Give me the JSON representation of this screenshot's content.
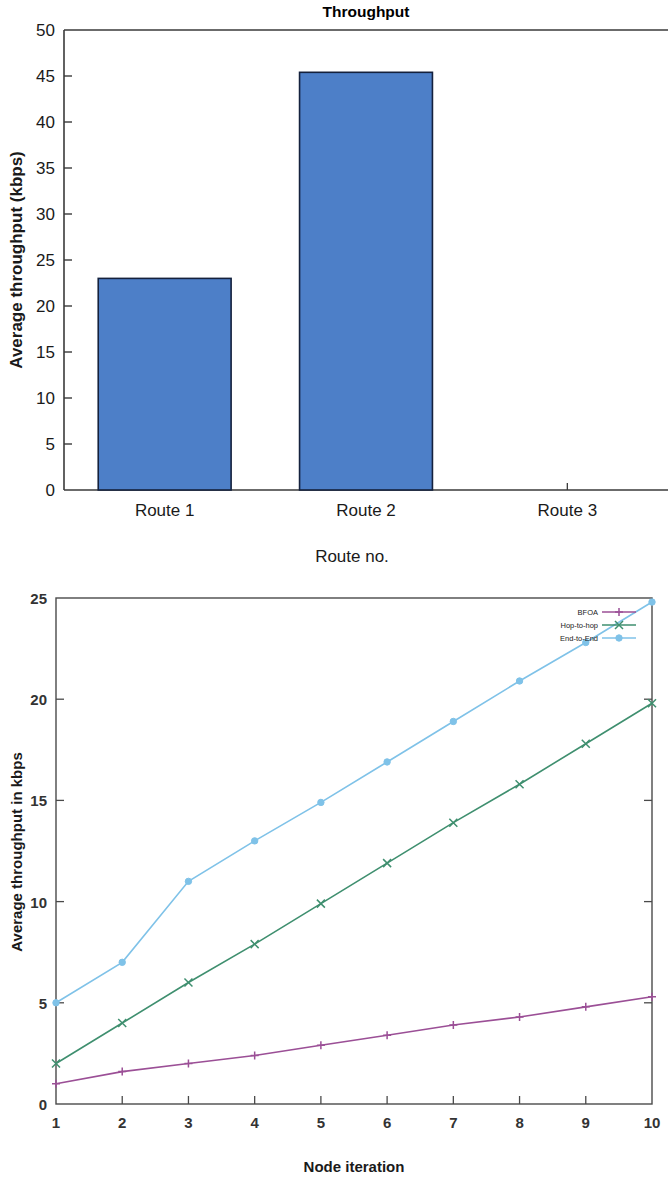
{
  "page": {
    "width": 668,
    "height": 1196,
    "background": "#ffffff"
  },
  "chart_data": [
    {
      "id": "throughput-bar-chart",
      "type": "bar",
      "title": "Throughput",
      "xlabel": "Route no.",
      "ylabel": "Average throughput (kbps)",
      "categories": [
        "Route 1",
        "Route 2",
        "Route 3"
      ],
      "values": [
        23,
        45.4,
        0
      ],
      "ylim": [
        0,
        50
      ],
      "yticks": [
        0,
        5,
        10,
        15,
        20,
        25,
        30,
        35,
        40,
        45,
        50
      ],
      "ytick_labels": [
        "0",
        "5",
        "10",
        "15",
        "20",
        "25",
        "30",
        "35",
        "40",
        "45",
        "50"
      ],
      "grid": false,
      "legend": null,
      "bar_color": "#4d7fc8",
      "bar_edge_color": "#14213d",
      "axis_color": "#3a3a3a",
      "title_color": "#000000"
    },
    {
      "id": "node-iteration-line-chart",
      "type": "line",
      "title": "",
      "xlabel": "Node iteration",
      "ylabel": "Average throughput in kbps",
      "x": [
        1,
        2,
        3,
        4,
        5,
        6,
        7,
        8,
        9,
        10
      ],
      "xtick_labels": [
        "1",
        "2",
        "3",
        "4",
        "5",
        "6",
        "7",
        "8",
        "9",
        "10"
      ],
      "xlim": [
        1,
        10
      ],
      "ylim": [
        0,
        25
      ],
      "yticks": [
        0,
        5,
        10,
        15,
        20,
        25
      ],
      "ytick_labels": [
        "0",
        "5",
        "10",
        "15",
        "20",
        "25"
      ],
      "grid": false,
      "legend_position": "top-right",
      "series": [
        {
          "name": "BFOA",
          "color": "#9b4f96",
          "marker": "plus",
          "values": [
            1.0,
            1.6,
            2.0,
            2.4,
            2.9,
            3.4,
            3.9,
            4.3,
            4.8,
            5.3
          ]
        },
        {
          "name": "Hop-to-hop",
          "color": "#3f8f6f",
          "marker": "cross",
          "values": [
            2.0,
            4.0,
            6.0,
            7.9,
            9.9,
            11.9,
            13.9,
            15.8,
            17.8,
            19.8
          ]
        },
        {
          "name": "End-to-End",
          "color": "#7fc2e8",
          "marker": "circle",
          "values": [
            5.0,
            7.0,
            11.0,
            13.0,
            14.9,
            16.9,
            18.9,
            20.9,
            22.8,
            24.8
          ]
        }
      ]
    }
  ]
}
